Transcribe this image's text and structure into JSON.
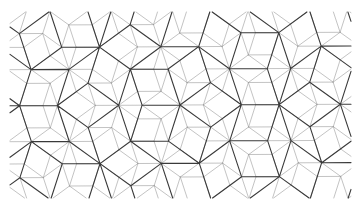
{
  "image": {
    "subject": "Penrose rhombus tiling (two overlaid scales)",
    "colors": {
      "background": "#ffffff",
      "coarse_edges": "#3a3a3a",
      "fine_edges": "#9a9a9a"
    },
    "tiling": {
      "type": "penrose-p3",
      "overlay_levels": [
        "coarse",
        "fine"
      ]
    }
  }
}
